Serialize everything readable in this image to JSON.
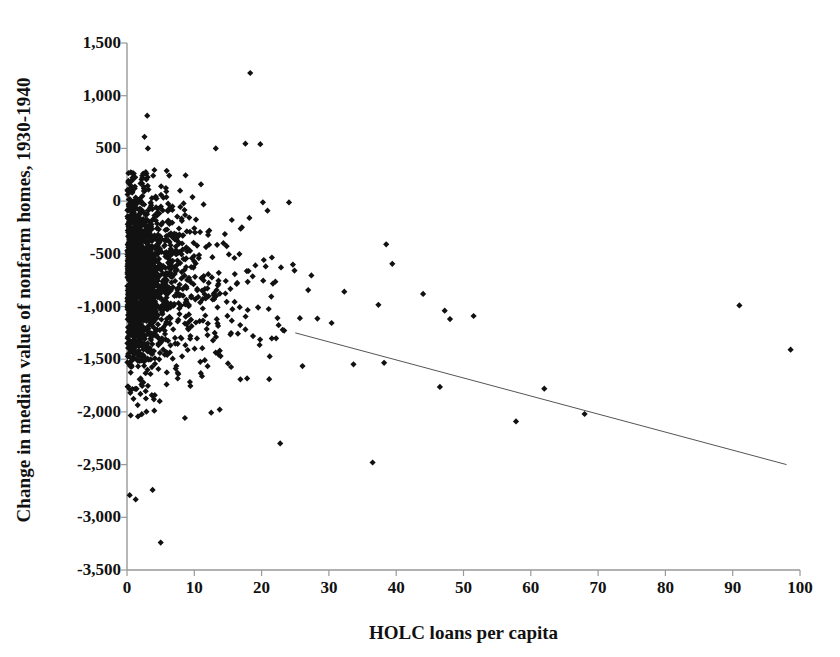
{
  "chart_data": {
    "type": "scatter",
    "title": "",
    "xlabel": "HOLC loans per capita",
    "ylabel": "Change in median value of nonfarm homes, 1930-1940",
    "xlim": [
      0,
      100
    ],
    "ylim": [
      -3500,
      1500
    ],
    "xticks": [
      0,
      10,
      20,
      30,
      40,
      50,
      60,
      70,
      80,
      90,
      100
    ],
    "xtick_labels": [
      "0",
      "10",
      "20",
      "30",
      "40",
      "50",
      "60",
      "70",
      "80",
      "90",
      "100"
    ],
    "yticks": [
      1500,
      1000,
      500,
      0,
      -500,
      -1000,
      -1500,
      -2000,
      -2500,
      -3000,
      -3500
    ],
    "ytick_labels": [
      "1,500",
      "1,000",
      "500",
      "0",
      "-500",
      "-1,000",
      "-1,500",
      "-2,000",
      "-2,500",
      "-3,000",
      "-3,500"
    ],
    "grid": false,
    "legend": null,
    "marker": "diamond",
    "marker_color": "#111111",
    "marker_size": 5,
    "trendline": {
      "type": "linear",
      "color": "#555555",
      "width": 1,
      "x_start": 25.0,
      "y_start": -1250,
      "x_end": 98.0,
      "y_end": -2500
    },
    "n_points": 1870,
    "outliers": [
      {
        "x": 18.3,
        "y": 1215
      },
      {
        "x": 3.0,
        "y": 810
      },
      {
        "x": 2.6,
        "y": 610
      },
      {
        "x": 3.1,
        "y": 500
      },
      {
        "x": 13.2,
        "y": 500
      },
      {
        "x": 17.6,
        "y": 545
      },
      {
        "x": 19.8,
        "y": 540
      },
      {
        "x": 91.0,
        "y": -990
      },
      {
        "x": 98.6,
        "y": -1410
      },
      {
        "x": 5.0,
        "y": -3240
      },
      {
        "x": 0.4,
        "y": -2790
      },
      {
        "x": 1.3,
        "y": -2830
      },
      {
        "x": 3.8,
        "y": -2740
      },
      {
        "x": 36.5,
        "y": -2480
      },
      {
        "x": 68.0,
        "y": -2020
      },
      {
        "x": 57.8,
        "y": -2090
      },
      {
        "x": 62.0,
        "y": -1780
      },
      {
        "x": 47.2,
        "y": -1040
      },
      {
        "x": 44.0,
        "y": -880
      },
      {
        "x": 48.0,
        "y": -1120
      },
      {
        "x": 51.5,
        "y": -1090
      }
    ],
    "series": [
      {
        "name": "US counties",
        "description": "Each marker is one county: HOLC loans per capita (x) vs. change in median value of nonfarm homes 1930-1940 (y)"
      }
    ]
  },
  "axes": {
    "y_title": "Change in median value of nonfarm homes, 1930-1940",
    "x_title": "HOLC loans per capita"
  }
}
